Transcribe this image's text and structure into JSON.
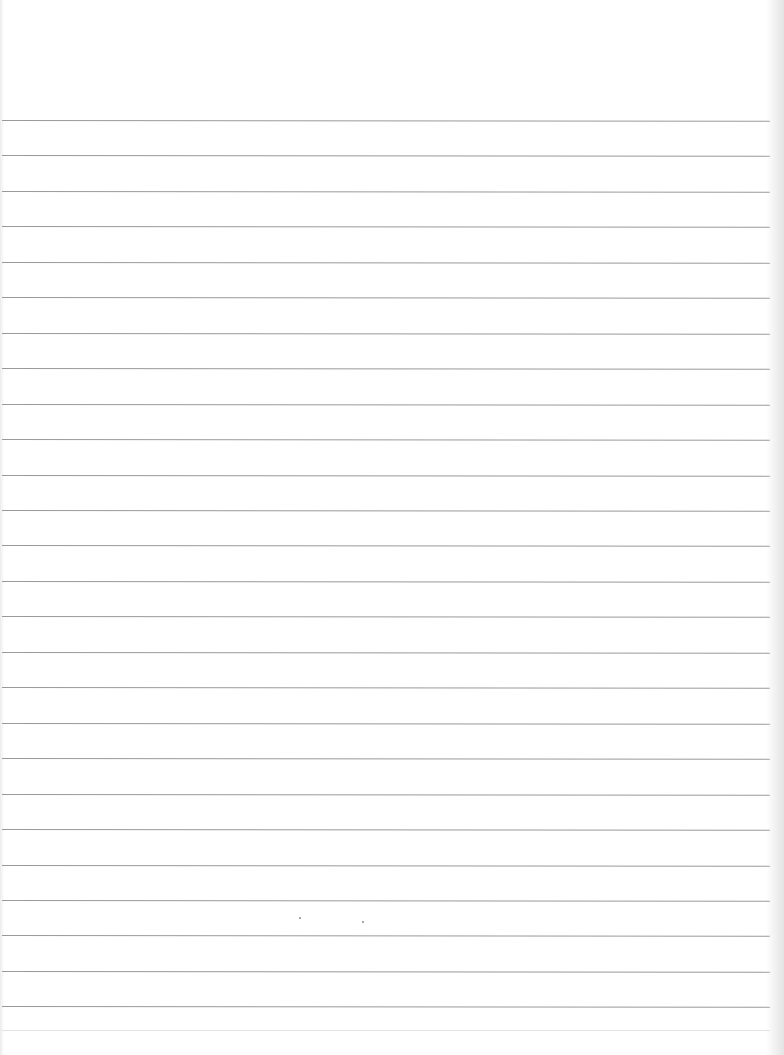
{
  "document": {
    "type": "lined-paper",
    "background_color": "#ffffff",
    "rule_color": "#9a9a9a",
    "top_margin_px": 120,
    "line_spacing_px": 35.45,
    "line_count": 26,
    "text_content": ""
  }
}
